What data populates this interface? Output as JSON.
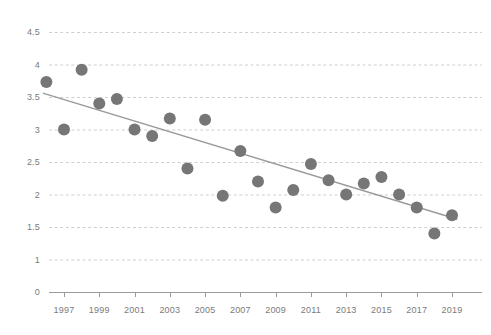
{
  "chart_data": {
    "type": "scatter",
    "title": "",
    "subtitle": "",
    "xlabel": "",
    "ylabel": "",
    "xlim": [
      1995.2,
      2020.0
    ],
    "ylim": [
      0,
      4.75
    ],
    "grid": true,
    "legend": false,
    "y_ticks": [
      "4.5",
      "4",
      "3.5",
      "3",
      "2.5",
      "2",
      "1.5",
      "1",
      "0"
    ],
    "y_tick_values": [
      4.5,
      4,
      3.5,
      3,
      2.5,
      2,
      1.5,
      1,
      0
    ],
    "x_ticks": [
      "1997",
      "1999",
      "2001",
      "2003",
      "2005",
      "2007",
      "2009",
      "2011",
      "2013",
      "2015",
      "2017",
      "2019"
    ],
    "x_tick_values": [
      1997,
      1999,
      2001,
      2003,
      2005,
      2007,
      2009,
      2011,
      2013,
      2015,
      2017,
      2019
    ],
    "x": [
      1996,
      1997,
      1998,
      1999,
      2000,
      2001,
      2002,
      2003,
      2004,
      2005,
      2006,
      2007,
      2008,
      2009,
      2010,
      2011,
      2012,
      2013,
      2014,
      2015,
      2016,
      2017,
      2018,
      2019
    ],
    "values": [
      3.73,
      3.0,
      3.92,
      3.4,
      3.47,
      3.0,
      2.9,
      3.17,
      2.4,
      3.15,
      1.98,
      2.67,
      2.2,
      1.8,
      2.07,
      2.47,
      2.22,
      2.0,
      2.17,
      2.27,
      2.0,
      1.8,
      1.4,
      1.68
    ],
    "series": [
      {
        "name": "data-points",
        "type": "scatter",
        "marker_color": "#767676",
        "marker_radius": 6,
        "values": [
          3.73,
          3.0,
          3.92,
          3.4,
          3.47,
          3.0,
          2.9,
          3.17,
          2.4,
          3.15,
          1.98,
          2.67,
          2.2,
          1.8,
          2.07,
          2.47,
          2.22,
          2.0,
          2.17,
          2.27,
          2.0,
          1.8,
          1.4,
          1.68
        ]
      },
      {
        "name": "trendline",
        "type": "line",
        "line_color": "#9a9a9a",
        "x_start": 1995.8,
        "y_start": 3.56,
        "x_end": 2019.3,
        "y_end": 1.62
      }
    ],
    "colors": {
      "marker": "#767676",
      "trendline": "#9a9a9a",
      "gridline": "#cfcfcf",
      "axis": "#9b9b9b",
      "tick_text": "#7b7b7b",
      "background": "#ffffff"
    }
  }
}
